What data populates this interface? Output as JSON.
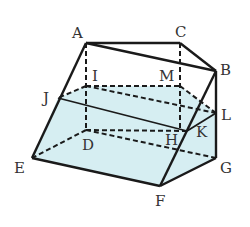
{
  "diagram": {
    "type": "solid-geometry",
    "fill_color": "#d6eef2",
    "stroke_color": "#1a1a1a",
    "points": {
      "A": {
        "x": 86,
        "y": 43,
        "label": "A",
        "lx": 72,
        "ly": 38
      },
      "C": {
        "x": 180,
        "y": 43,
        "label": "C",
        "lx": 175,
        "ly": 37
      },
      "B": {
        "x": 216,
        "y": 71,
        "label": "B",
        "lx": 220,
        "ly": 75
      },
      "I": {
        "x": 86,
        "y": 86,
        "label": "I",
        "lx": 92,
        "ly": 81
      },
      "M": {
        "x": 180,
        "y": 86,
        "label": "M",
        "lx": 159,
        "ly": 81
      },
      "J": {
        "x": 58,
        "y": 98,
        "label": "J",
        "lx": 43,
        "ly": 103
      },
      "L": {
        "x": 216,
        "y": 113,
        "label": "L",
        "lx": 221,
        "ly": 120
      },
      "D": {
        "x": 86,
        "y": 130,
        "label": "D",
        "lx": 82,
        "ly": 150
      },
      "H": {
        "x": 180,
        "y": 130,
        "label": "H",
        "lx": 165,
        "ly": 145
      },
      "K": {
        "x": 187,
        "y": 131,
        "label": "K",
        "lx": 196,
        "ly": 137
      },
      "E": {
        "x": 32,
        "y": 158,
        "label": "E",
        "lx": 14,
        "ly": 173
      },
      "F": {
        "x": 160,
        "y": 186,
        "label": "F",
        "lx": 155,
        "ly": 206
      },
      "G": {
        "x": 216,
        "y": 158,
        "label": "G",
        "lx": 220,
        "ly": 173
      }
    },
    "labels": [
      "A",
      "B",
      "C",
      "D",
      "E",
      "F",
      "G",
      "H",
      "I",
      "J",
      "K",
      "L",
      "M"
    ],
    "solid_edges": [
      "AC",
      "AB",
      "CB",
      "AE",
      "BG",
      "BF",
      "EF",
      "FG",
      "JK",
      "KL"
    ],
    "dashed_edges": [
      "AD",
      "CH",
      "IM",
      "IJ",
      "ML",
      "DE",
      "DH",
      "DG",
      "IL"
    ]
  }
}
